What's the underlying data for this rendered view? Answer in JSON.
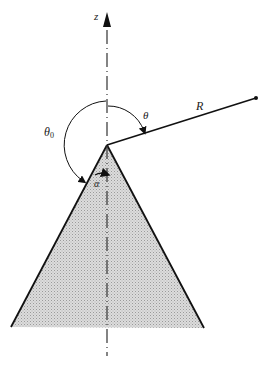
{
  "diagram": {
    "labels": {
      "z_axis": "z",
      "theta": "θ",
      "R": "R",
      "theta0_base": "θ",
      "theta0_sub": "0",
      "alpha": "α"
    },
    "colors": {
      "line": "#111111",
      "fill": "#d4d4d4",
      "background": "#ffffff"
    }
  }
}
